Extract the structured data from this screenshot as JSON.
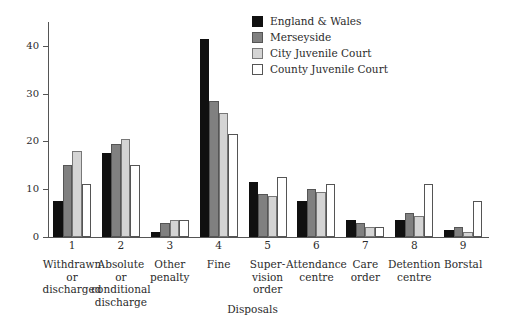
{
  "chart_data": {
    "type": "bar",
    "title": "",
    "xlabel": "Disposals",
    "ylabel": "",
    "ylim": [
      0,
      45
    ],
    "yticks": [
      0,
      10,
      20,
      30,
      40
    ],
    "ytick_labels": [
      "0",
      "10",
      "20",
      "30",
      "40"
    ],
    "grid": false,
    "legend_position": "top-right",
    "categories": [
      "Withdrawn\nor\ndischarged",
      "Absolute\nor\nconditional\ndischarge",
      "Other\npenalty",
      "Fine",
      "Super-\nvision\norder",
      "Attendance\ncentre",
      "Care\norder",
      "Detention\ncentre",
      "Borstal"
    ],
    "category_numbers": [
      "1",
      "2",
      "3",
      "4",
      "5",
      "6",
      "7",
      "8",
      "9"
    ],
    "series": [
      {
        "name": "England & Wales",
        "color": "#101010",
        "border": "#101010",
        "values": [
          7.5,
          17.5,
          1.0,
          41.5,
          11.5,
          7.5,
          3.5,
          3.5,
          1.5
        ]
      },
      {
        "name": "Merseyside",
        "color": "#808080",
        "border": "#555555",
        "values": [
          15.0,
          19.5,
          3.0,
          28.5,
          9.0,
          10.0,
          3.0,
          5.0,
          2.0
        ]
      },
      {
        "name": "City Juvenile Court",
        "color": "#d4d4d4",
        "border": "#777777",
        "values": [
          18.0,
          20.5,
          3.5,
          26.0,
          8.5,
          9.5,
          2.0,
          4.5,
          1.0
        ]
      },
      {
        "name": "County Juvenile Court",
        "color": "#ffffff",
        "border": "#555555",
        "values": [
          11.0,
          15.0,
          3.5,
          21.5,
          12.5,
          11.0,
          2.0,
          11.0,
          7.5
        ]
      }
    ]
  },
  "axis": {
    "x_title": "Disposals"
  }
}
